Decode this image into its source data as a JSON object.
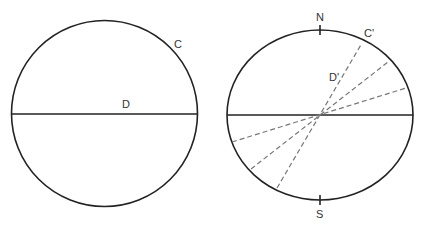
{
  "colors": {
    "background": "#ffffff",
    "stroke": "#222222",
    "dashed": "#777777",
    "label": "#333333"
  },
  "left_figure": {
    "shape": "circle",
    "center": [
      104.5,
      113.5
    ],
    "radius": 93,
    "labels": {
      "circle": "C",
      "diameter": "D"
    }
  },
  "right_figure": {
    "shape": "ellipse",
    "center": [
      320,
      115
    ],
    "rx": 93,
    "ry": 85,
    "labels": {
      "north": "N",
      "south": "S",
      "ellipse": "C'",
      "diameter": "D'"
    },
    "dashed_lines": [
      {
        "from": [
          277,
          188
        ],
        "to": [
          362,
          43
        ]
      },
      {
        "from": [
          251,
          169
        ],
        "to": [
          388,
          62
        ]
      },
      {
        "from": [
          232,
          142
        ],
        "to": [
          406,
          88
        ]
      }
    ]
  }
}
